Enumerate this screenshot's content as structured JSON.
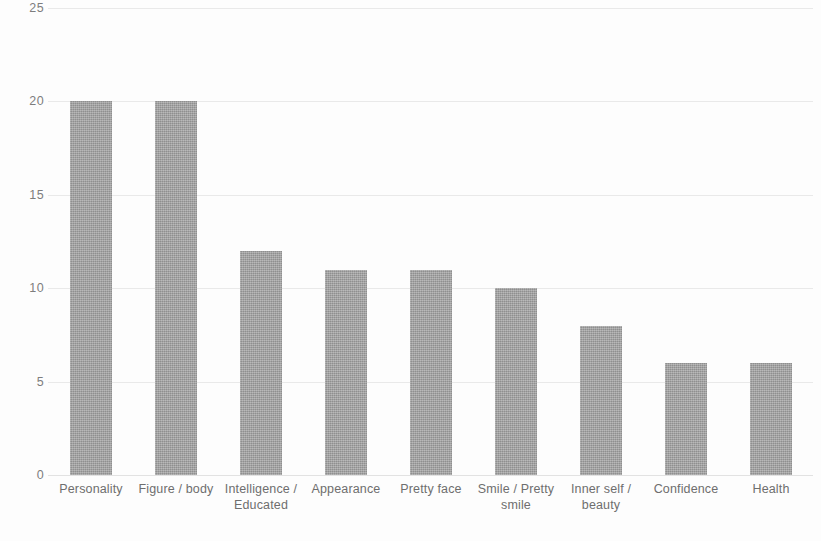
{
  "chart_data": {
    "type": "bar",
    "title": "",
    "subtitle": "",
    "xlabel": "",
    "ylabel": "",
    "ylim": [
      0,
      25
    ],
    "ytick_values": [
      25,
      20,
      15,
      10,
      5,
      0
    ],
    "ytick_labels": [
      "25",
      "20",
      "15",
      "10",
      "5",
      "0"
    ],
    "y_tick_interval": 5,
    "grid": true,
    "grid_axis": "y",
    "legend": false,
    "legend_position": "none",
    "bar_color": "#9d9d9d",
    "gridline_color": "#e9e9e9",
    "background_color": "#fdfdfd",
    "text_color": "#6e6e6e",
    "categories": [
      "Personality",
      "Figure / body",
      "Intelligence / Educated",
      "Appearance",
      "Pretty face",
      "Smile / Pretty smile",
      "Inner self / beauty",
      "Confidence",
      "Health"
    ],
    "category_lines": [
      [
        "Personality"
      ],
      [
        "Figure / body"
      ],
      [
        "Intelligence /",
        "Educated"
      ],
      [
        "Appearance"
      ],
      [
        "Pretty face"
      ],
      [
        "Smile / Pretty",
        "smile"
      ],
      [
        "Inner self /",
        "beauty"
      ],
      [
        "Confidence"
      ],
      [
        "Health"
      ]
    ],
    "values": [
      20,
      20,
      12,
      11,
      11,
      10,
      8,
      6,
      6
    ],
    "series": [
      {
        "name": "",
        "values": [
          20,
          20,
          12,
          11,
          11,
          10,
          8,
          6,
          6
        ]
      }
    ]
  }
}
